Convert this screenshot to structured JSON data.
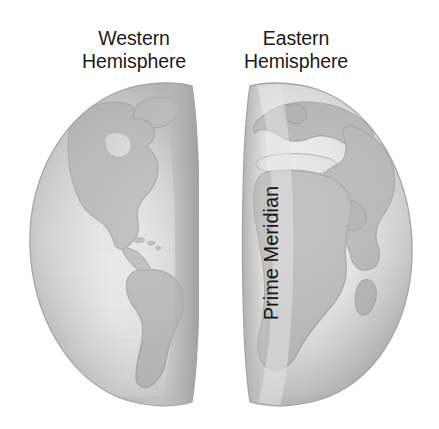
{
  "figure": {
    "title_western": {
      "line1": "Western",
      "line2": "Hemisphere"
    },
    "title_eastern": {
      "line1": "Eastern",
      "line2": "Hemisphere"
    },
    "prime_meridian_label": "Prime Meridian",
    "background_color": "#ffffff",
    "text_color": "#1b1b1b"
  },
  "colors": {
    "ocean_light": "#fbfbfb",
    "ocean_mid": "#d8d8d8",
    "ocean_shadow": "#a9a9a9",
    "land_outline": "#9a9a9a",
    "land_fill": "#b4b4b4",
    "terminator_band": "#c9c9c9",
    "rim_edge": "#8f8f8f"
  },
  "globes": [
    {
      "name": "western-hemisphere-globe",
      "side": "west",
      "landmasses": [
        "North America",
        "Greenland",
        "South America",
        "Central America",
        "Caribbean"
      ]
    },
    {
      "name": "eastern-hemisphere-globe",
      "side": "east",
      "landmasses": [
        "Europe",
        "Africa",
        "Asia",
        "Arabian Peninsula",
        "Madagascar",
        "Scandinavia"
      ]
    }
  ]
}
